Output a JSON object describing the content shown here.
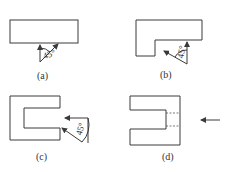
{
  "figure": {
    "panels": [
      {
        "id": "a",
        "label": "(a)",
        "angle_label": "45°",
        "description": "Rectangular part with 45° angle indicated below"
      },
      {
        "id": "b",
        "label": "(b)",
        "angle_label": "45°",
        "description": "L-shaped part with 45° angle at inner corner"
      },
      {
        "id": "c",
        "label": "(c)",
        "angle_label": "45°",
        "description": "C-shaped part with 45° angle at open side"
      },
      {
        "id": "d",
        "label": "(d)",
        "description": "C-shaped part with dashed hidden lines and direction arrow"
      }
    ],
    "colors": {
      "line": "#3a3a3a",
      "text": "#333333",
      "background": "#ffffff"
    }
  }
}
